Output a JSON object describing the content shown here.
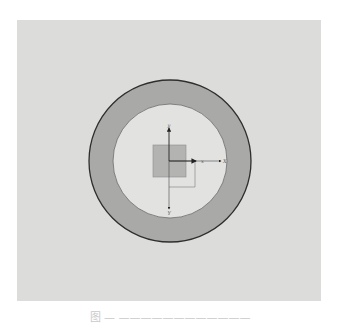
{
  "figure": {
    "panel_background": "#dcdddb",
    "ring": {
      "center": [
        170,
        161
      ],
      "outer_radius": 81,
      "inner_radius": 57,
      "fill": "#a9aaa8",
      "outline": "#2e2e2e",
      "inner_fill": "#e2e3e1"
    },
    "square": {
      "x": 153,
      "y": 145,
      "width": 33,
      "height": 32,
      "fill": "#b3b4b2",
      "stroke": "#8a8a8a"
    },
    "offset_outline": {
      "x": 169,
      "y": 161,
      "width": 26,
      "height": 26,
      "stroke": "#8a8a8a"
    },
    "axes": {
      "origin": [
        169,
        161
      ],
      "local_x_label": "x",
      "local_y_label": "y",
      "global_x_label": "X",
      "global_y_label": "Y"
    }
  },
  "caption": {
    "text": "图 — ————————————"
  }
}
